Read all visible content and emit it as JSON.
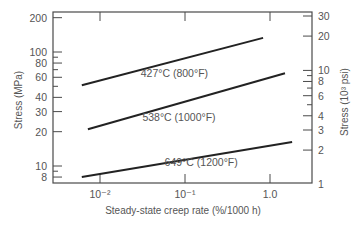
{
  "chart_data": {
    "type": "line",
    "title": "",
    "xlabel": "Steady-state creep rate (%/1000 h)",
    "ylabel": "Stress (MPa)",
    "ylabel_right": "Stress (10³ psi)",
    "xscale": "log",
    "yscale": "log",
    "xlim": [
      0.0028,
      3.1
    ],
    "ylim": [
      7,
      220
    ],
    "ylim_right": [
      1,
      32
    ],
    "grid": false,
    "legend": "inline labels on lines",
    "x_ticks": [
      {
        "value": 0.01,
        "label": "10⁻²"
      },
      {
        "value": 0.1,
        "label": "10⁻¹"
      },
      {
        "value": 1.0,
        "label": "1.0"
      }
    ],
    "y_ticks_left": [
      {
        "value": 200,
        "label": "200"
      },
      {
        "value": 100,
        "label": "100"
      },
      {
        "value": 90,
        "label": ""
      },
      {
        "value": 80,
        "label": "80"
      },
      {
        "value": 70,
        "label": ""
      },
      {
        "value": 60,
        "label": "60"
      },
      {
        "value": 50,
        "label": ""
      },
      {
        "value": 40,
        "label": "40"
      },
      {
        "value": 30,
        "label": "30"
      },
      {
        "value": 20,
        "label": "20"
      },
      {
        "value": 10,
        "label": "10"
      },
      {
        "value": 9,
        "label": ""
      },
      {
        "value": 8,
        "label": "8"
      }
    ],
    "y_ticks_right": [
      {
        "value": 30,
        "label": "30"
      },
      {
        "value": 20,
        "label": "20"
      },
      {
        "value": 10,
        "label": "10"
      },
      {
        "value": 9,
        "label": ""
      },
      {
        "value": 8,
        "label": "8"
      },
      {
        "value": 7,
        "label": ""
      },
      {
        "value": 6,
        "label": "6"
      },
      {
        "value": 5,
        "label": ""
      },
      {
        "value": 4,
        "label": "4"
      },
      {
        "value": 3,
        "label": "3"
      },
      {
        "value": 2,
        "label": "2"
      },
      {
        "value": 1,
        "label": "1"
      }
    ],
    "series": [
      {
        "name": "427°C (800°F)",
        "x": [
          0.0061,
          0.83
        ],
        "y": [
          51,
          133
        ],
        "label_pos": [
          0.075,
          60
        ]
      },
      {
        "name": "538°C (1000°F)",
        "x": [
          0.0072,
          1.5
        ],
        "y": [
          21,
          65
        ],
        "label_pos": [
          0.085,
          25
        ]
      },
      {
        "name": "649°C (1200°F)",
        "x": [
          0.0061,
          1.82
        ],
        "y": [
          8,
          16.2
        ],
        "label_pos": [
          0.155,
          10
        ]
      }
    ],
    "colors": {
      "line": "#222222",
      "axis": "#4a4a4a",
      "text": "#555555"
    }
  }
}
